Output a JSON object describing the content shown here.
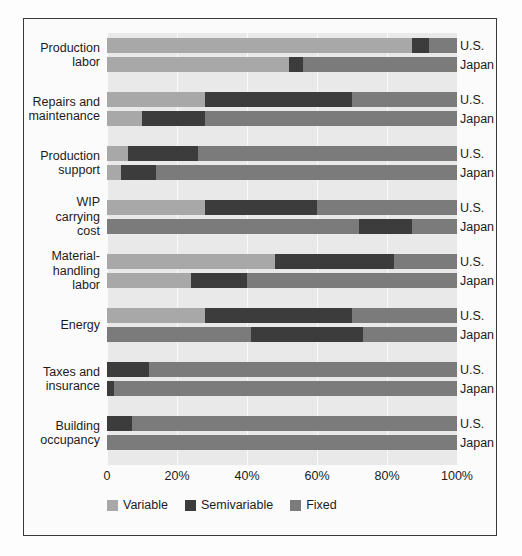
{
  "chart_data": {
    "type": "bar",
    "orientation": "horizontal",
    "stacked": true,
    "title": "",
    "subtitle": "",
    "xlabel": "",
    "ylabel": "",
    "xlim": [
      0,
      100
    ],
    "grid": true,
    "legend_position": "bottom-left",
    "tick_labels": [
      "0",
      "20%",
      "40%",
      "60%",
      "80%",
      "100%"
    ],
    "tick_values": [
      0,
      20,
      40,
      60,
      80,
      100
    ],
    "categories": [
      "Production labor",
      "Repairs and maintenance",
      "Production support",
      "WIP carrying cost",
      "Material-handling labor",
      "Energy",
      "Taxes and insurance",
      "Building occupancy"
    ],
    "category_lines": [
      [
        "Production",
        "labor"
      ],
      [
        "Repairs and",
        "maintenance"
      ],
      [
        "Production",
        "support"
      ],
      [
        "WIP",
        "carrying",
        "cost"
      ],
      [
        "Material-",
        "handling",
        "labor"
      ],
      [
        "Energy"
      ],
      [
        "Taxes and",
        "insurance"
      ],
      [
        "Building",
        "occupancy"
      ]
    ],
    "series_names": [
      "U.S.",
      "Japan"
    ],
    "components": [
      "Variable",
      "Semivariable",
      "Fixed"
    ],
    "colors": {
      "Variable": "#a8a8a8",
      "Semivariable": "#3c3c3c",
      "Fixed": "#7b7b7b"
    },
    "groups": [
      {
        "category": "Production labor",
        "bars": [
          {
            "series": "U.S.",
            "Variable": 87,
            "Semivariable": 5,
            "Fixed": 8
          },
          {
            "series": "Japan",
            "Variable": 52,
            "Semivariable": 4,
            "Fixed": 44
          }
        ]
      },
      {
        "category": "Repairs and maintenance",
        "bars": [
          {
            "series": "U.S.",
            "Variable": 28,
            "Semivariable": 42,
            "Fixed": 30
          },
          {
            "series": "Japan",
            "Variable": 10,
            "Semivariable": 18,
            "Fixed": 72
          }
        ]
      },
      {
        "category": "Production support",
        "bars": [
          {
            "series": "U.S.",
            "Variable": 6,
            "Semivariable": 20,
            "Fixed": 74
          },
          {
            "series": "Japan",
            "Variable": 4,
            "Semivariable": 10,
            "Fixed": 86
          }
        ]
      },
      {
        "category": "WIP carrying cost",
        "bars": [
          {
            "series": "U.S.",
            "Variable": 28,
            "Semivariable": 32,
            "Fixed": 40
          },
          {
            "series": "Japan",
            "Variable": 0,
            "Semivariable": 0,
            "Fixed": 100,
            "split": [
              72,
              15,
              13
            ]
          }
        ]
      },
      {
        "category": "Material-handling labor",
        "bars": [
          {
            "series": "U.S.",
            "Variable": 48,
            "Semivariable": 34,
            "Fixed": 18
          },
          {
            "series": "Japan",
            "Variable": 24,
            "Semivariable": 16,
            "Fixed": 60
          }
        ]
      },
      {
        "category": "Energy",
        "bars": [
          {
            "series": "U.S.",
            "Variable": 28,
            "Semivariable": 42,
            "Fixed": 30
          },
          {
            "series": "Japan",
            "Variable": 0,
            "Semivariable": 32,
            "Fixed": 68,
            "split": [
              41,
              32,
              27
            ]
          }
        ]
      },
      {
        "category": "Taxes and insurance",
        "bars": [
          {
            "series": "U.S.",
            "Variable": 0,
            "Semivariable": 12,
            "Fixed": 88
          },
          {
            "series": "Japan",
            "Variable": 0,
            "Semivariable": 2,
            "Fixed": 98
          }
        ]
      },
      {
        "category": "Building occupancy",
        "bars": [
          {
            "series": "U.S.",
            "Variable": 0,
            "Semivariable": 7,
            "Fixed": 93
          },
          {
            "series": "Japan",
            "Variable": 0,
            "Semivariable": 0,
            "Fixed": 100
          }
        ]
      }
    ]
  },
  "legend": {
    "items": [
      {
        "label": "Variable",
        "color": "#a8a8a8",
        "icon": "square-swatch-icon"
      },
      {
        "label": "Semivariable",
        "color": "#3c3c3c",
        "icon": "square-swatch-icon"
      },
      {
        "label": "Fixed",
        "color": "#7b7b7b",
        "icon": "square-swatch-icon"
      }
    ]
  }
}
